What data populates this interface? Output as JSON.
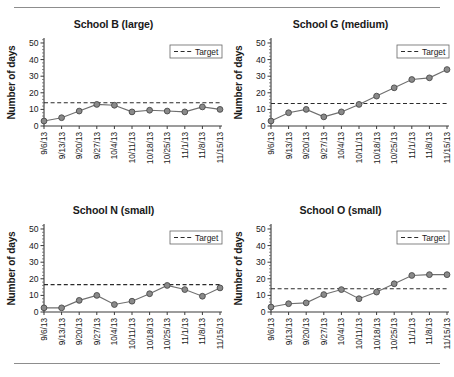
{
  "figure": {
    "divider_top": "rule",
    "divider_bottom": "rule",
    "y_axis_label": "Number of days",
    "legend_label": "Target",
    "y_ticks": [
      "0",
      "10",
      "20",
      "30",
      "40",
      "50"
    ],
    "x_ticks": [
      "9/6/13",
      "9/13/13",
      "9/20/13",
      "9/27/13",
      "10/4/13",
      "10/11/13",
      "10/18/13",
      "10/25/13",
      "11/1/13",
      "11/8/13",
      "11/15/13"
    ]
  },
  "chart_data": [
    {
      "type": "line",
      "title": "School B (large)",
      "xlabel": "",
      "ylabel": "Number of days",
      "ylim": [
        0,
        53
      ],
      "yticks": [
        0,
        10,
        20,
        30,
        40,
        50
      ],
      "grid": false,
      "legend_position": "top-right",
      "categories": [
        "9/6/13",
        "9/13/13",
        "9/20/13",
        "9/27/13",
        "10/4/13",
        "10/11/13",
        "10/18/13",
        "10/25/13",
        "11/1/13",
        "11/8/13",
        "11/15/13"
      ],
      "series": [
        {
          "name": "Number of days",
          "values": [
            3,
            5,
            9,
            13,
            12.5,
            8.5,
            9.5,
            9,
            8.5,
            11.5,
            10
          ]
        }
      ],
      "target": {
        "label": "Target",
        "value": 14
      }
    },
    {
      "type": "line",
      "title": "School G (medium)",
      "xlabel": "",
      "ylabel": "Number of days",
      "ylim": [
        0,
        53
      ],
      "yticks": [
        0,
        10,
        20,
        30,
        40,
        50
      ],
      "grid": false,
      "legend_position": "top-right",
      "categories": [
        "9/6/13",
        "9/13/13",
        "9/20/13",
        "9/27/13",
        "10/4/13",
        "10/11/13",
        "10/18/13",
        "10/25/13",
        "11/1/13",
        "11/8/13",
        "11/15/13"
      ],
      "series": [
        {
          "name": "Number of days",
          "values": [
            3,
            8,
            10,
            5.5,
            8.5,
            13,
            18,
            23,
            28,
            29,
            34
          ]
        }
      ],
      "target": {
        "label": "Target",
        "value": 13.5
      }
    },
    {
      "type": "line",
      "title": "School N (small)",
      "xlabel": "",
      "ylabel": "Number of days",
      "ylim": [
        0,
        53
      ],
      "yticks": [
        0,
        10,
        20,
        30,
        40,
        50
      ],
      "grid": false,
      "legend_position": "top-right",
      "categories": [
        "9/6/13",
        "9/13/13",
        "9/20/13",
        "9/27/13",
        "10/4/13",
        "10/11/13",
        "10/18/13",
        "10/25/13",
        "11/1/13",
        "11/8/13",
        "11/15/13"
      ],
      "series": [
        {
          "name": "Number of days",
          "values": [
            2.5,
            2.5,
            7,
            10,
            4.5,
            6.5,
            11,
            16,
            13.5,
            9.5,
            14.5
          ]
        }
      ],
      "target": {
        "label": "Target",
        "value": 16.5
      }
    },
    {
      "type": "line",
      "title": "School O (small)",
      "xlabel": "",
      "ylabel": "Number of days",
      "ylim": [
        0,
        53
      ],
      "yticks": [
        0,
        10,
        20,
        30,
        40,
        50
      ],
      "grid": false,
      "legend_position": "top-right",
      "categories": [
        "9/6/13",
        "9/13/13",
        "9/20/13",
        "9/27/13",
        "10/4/13",
        "10/11/13",
        "10/18/13",
        "10/25/13",
        "11/1/13",
        "11/8/13",
        "11/15/13"
      ],
      "series": [
        {
          "name": "Number of days",
          "values": [
            3,
            5,
            5.5,
            10.5,
            13.5,
            8,
            12,
            17,
            22,
            22.5,
            22.5
          ]
        }
      ],
      "target": {
        "label": "Target",
        "value": 14
      }
    }
  ]
}
